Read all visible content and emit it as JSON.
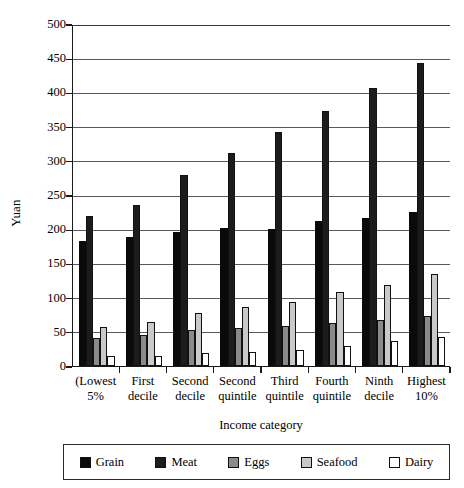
{
  "chart_data": {
    "type": "bar",
    "title": "",
    "xlabel": "Income category",
    "ylabel": "Yuan",
    "ylim": [
      0,
      500
    ],
    "yticks": [
      0,
      50,
      100,
      150,
      200,
      250,
      300,
      350,
      400,
      450,
      500
    ],
    "grid": true,
    "legend_position": "bottom",
    "categories": [
      "(Lowest 5%",
      "First decile",
      "Second decile",
      "Second quintile",
      "Third quintile",
      "Fourth quintile",
      "Ninth decile",
      "Highest 10%"
    ],
    "category_lines": [
      [
        "(Lowest",
        "5%"
      ],
      [
        "First",
        "decile"
      ],
      [
        "Second",
        "decile"
      ],
      [
        "Second",
        "quintile"
      ],
      [
        "Third",
        "quintile"
      ],
      [
        "Fourth",
        "quintile"
      ],
      [
        "Ninth",
        "decile"
      ],
      [
        "Highest",
        "10%"
      ]
    ],
    "series": [
      {
        "name": "Grain",
        "color": "#0a0a0a",
        "values": [
          183,
          188,
          196,
          202,
          201,
          212,
          217,
          225
        ]
      },
      {
        "name": "Meat",
        "color": "#1c1c1c",
        "values": [
          219,
          236,
          279,
          311,
          342,
          373,
          407,
          443
        ]
      },
      {
        "name": "Eggs",
        "color": "#8a8a8a",
        "values": [
          41,
          46,
          52,
          56,
          58,
          63,
          67,
          73
        ]
      },
      {
        "name": "Seafood",
        "color": "#c9c9c9",
        "values": [
          57,
          64,
          77,
          87,
          94,
          108,
          118,
          134
        ]
      },
      {
        "name": "Dairy",
        "color": "#ffffff",
        "values": [
          14,
          15,
          19,
          21,
          24,
          29,
          36,
          42
        ]
      }
    ]
  },
  "legend": {
    "items": [
      {
        "label": "Grain",
        "color": "#0a0a0a"
      },
      {
        "label": "Meat",
        "color": "#1c1c1c"
      },
      {
        "label": "Eggs",
        "color": "#8a8a8a"
      },
      {
        "label": "Seafood",
        "color": "#c9c9c9"
      },
      {
        "label": "Dairy",
        "color": "#ffffff"
      }
    ]
  }
}
